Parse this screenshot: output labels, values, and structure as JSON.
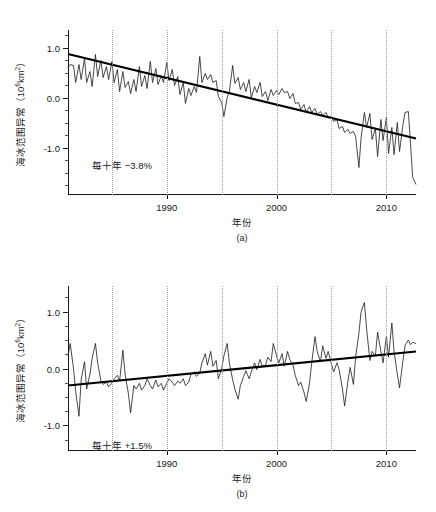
{
  "figure": {
    "background": "#ffffff",
    "line_color": "#1a1a1a",
    "trend_color": "#000000",
    "grid_color": "#9a9a9a"
  },
  "chart_data": [
    {
      "type": "line",
      "panel": "a",
      "caption": "(a)",
      "title": "",
      "xlabel": "年份",
      "ylabel": "海冰范围异常（10⁶km²）",
      "ylabel_text": "海冰范围异常（10",
      "ylabel_exp": "6",
      "ylabel_tail": "km",
      "ylabel_exp2": "2",
      "ylabel_close": "）",
      "annotation": "每十年 −3.8%",
      "trend_per_decade_percent": -3.8,
      "xlim": [
        1981,
        2012.7
      ],
      "ylim": [
        -1.95,
        1.35
      ],
      "grid": true,
      "grid_x": [
        1985,
        1990,
        1995,
        2000,
        2005,
        2010
      ],
      "xticks_labeled": [
        1990,
        2000,
        2010
      ],
      "xtick_labels": [
        "1990",
        "2000",
        "2010"
      ],
      "yticks_labeled": [
        1.0,
        0.0,
        -1.0
      ],
      "ytick_labels": [
        "1.0",
        "0.0",
        "-1.0"
      ],
      "yticks_minor": [
        1.25,
        0.75,
        0.5,
        0.25,
        -0.25,
        -0.5,
        -0.75,
        -1.25,
        -1.5,
        -1.75
      ],
      "trend_line": {
        "x": [
          1981,
          2012.7
        ],
        "y": [
          0.87,
          -0.82
        ]
      },
      "x": [
        1981.0,
        1981.2,
        1981.5,
        1981.7,
        1982.0,
        1982.2,
        1982.5,
        1982.7,
        1983.0,
        1983.2,
        1983.5,
        1983.7,
        1984.0,
        1984.2,
        1984.5,
        1984.7,
        1985.0,
        1985.2,
        1985.5,
        1985.7,
        1986.0,
        1986.2,
        1986.5,
        1986.7,
        1987.0,
        1987.2,
        1987.5,
        1987.7,
        1988.0,
        1988.2,
        1988.5,
        1988.7,
        1989.0,
        1989.2,
        1989.5,
        1989.7,
        1990.0,
        1990.2,
        1990.5,
        1990.7,
        1991.0,
        1991.2,
        1991.5,
        1991.7,
        1992.0,
        1992.2,
        1992.5,
        1992.7,
        1993.0,
        1993.2,
        1993.5,
        1993.7,
        1994.0,
        1994.2,
        1994.5,
        1994.7,
        1995.0,
        1995.2,
        1995.5,
        1995.7,
        1996.0,
        1996.2,
        1996.5,
        1996.7,
        1997.0,
        1997.2,
        1997.5,
        1997.7,
        1998.0,
        1998.2,
        1998.5,
        1998.7,
        1999.0,
        1999.2,
        1999.5,
        1999.7,
        2000.0,
        2000.2,
        2000.5,
        2000.7,
        2001.0,
        2001.2,
        2001.5,
        2001.7,
        2002.0,
        2002.2,
        2002.5,
        2002.7,
        2003.0,
        2003.2,
        2003.5,
        2003.7,
        2004.0,
        2004.2,
        2004.5,
        2004.7,
        2005.0,
        2005.2,
        2005.5,
        2005.7,
        2006.0,
        2006.2,
        2006.5,
        2006.7,
        2007.0,
        2007.2,
        2007.5,
        2007.7,
        2008.0,
        2008.2,
        2008.5,
        2008.7,
        2009.0,
        2009.2,
        2009.5,
        2009.7,
        2010.0,
        2010.2,
        2010.5,
        2010.7,
        2011.0,
        2011.2,
        2011.5,
        2011.7,
        2012.0,
        2012.2,
        2012.4,
        2012.7
      ],
      "y": [
        0.6,
        0.66,
        0.64,
        0.3,
        0.66,
        0.36,
        0.78,
        0.3,
        0.52,
        0.22,
        0.86,
        0.42,
        0.74,
        0.4,
        0.62,
        0.36,
        0.72,
        0.3,
        0.56,
        0.12,
        0.52,
        0.2,
        0.32,
        0.08,
        0.36,
        0.12,
        0.62,
        0.22,
        0.44,
        0.18,
        0.72,
        0.3,
        0.58,
        0.26,
        0.44,
        0.3,
        0.7,
        0.34,
        0.56,
        0.24,
        0.42,
        0.06,
        0.3,
        -0.12,
        0.18,
        0.04,
        0.22,
        0.1,
        0.82,
        0.3,
        0.48,
        0.36,
        0.46,
        0.3,
        0.34,
        0.02,
        -0.1,
        -0.38,
        0.0,
        0.12,
        0.64,
        0.28,
        0.4,
        0.16,
        0.3,
        0.12,
        0.36,
        0.0,
        0.22,
        0.1,
        0.3,
        0.02,
        0.12,
        -0.06,
        0.16,
        0.04,
        0.14,
        0.06,
        0.18,
        0.1,
        0.12,
        -0.02,
        0.08,
        -0.12,
        -0.1,
        -0.24,
        -0.14,
        -0.3,
        -0.18,
        -0.3,
        -0.22,
        -0.34,
        -0.28,
        -0.36,
        -0.3,
        -0.4,
        -0.38,
        -0.48,
        -0.44,
        -0.62,
        -0.58,
        -0.7,
        -0.64,
        -0.72,
        -0.68,
        -0.78,
        -1.4,
        -0.8,
        -0.3,
        -0.6,
        -0.32,
        -0.84,
        -0.62,
        -1.18,
        -0.44,
        -0.86,
        -0.4,
        -1.12,
        -0.6,
        -1.14,
        -0.5,
        -1.08,
        -0.56,
        -0.3,
        -0.28,
        -0.92,
        -1.6,
        -1.74
      ]
    },
    {
      "type": "line",
      "panel": "b",
      "caption": "(b)",
      "title": "",
      "xlabel": "年份",
      "ylabel": "海冰范围异常（10⁶km²）",
      "ylabel_text": "海冰范围异常（10",
      "ylabel_exp": "6",
      "ylabel_tail": "km",
      "ylabel_exp2": "2",
      "ylabel_close": "）",
      "annotation": "每十年 +1.5%",
      "trend_per_decade_percent": 1.5,
      "xlim": [
        1981,
        2012.7
      ],
      "ylim": [
        -1.45,
        1.45
      ],
      "grid": true,
      "grid_x": [
        1985,
        1990,
        1995,
        2000,
        2005,
        2010
      ],
      "xticks_labeled": [
        1990,
        2000,
        2010
      ],
      "xtick_labels": [
        "1990",
        "2000",
        "2010"
      ],
      "yticks_labeled": [
        1.0,
        0.0,
        -1.0
      ],
      "ytick_labels": [
        "1.0",
        "0.0",
        "-1.0"
      ],
      "yticks_minor": [
        1.25,
        0.75,
        0.5,
        0.25,
        -0.25,
        -0.5,
        -0.75,
        -1.25
      ],
      "trend_line": {
        "x": [
          1981,
          2012.7
        ],
        "y": [
          -0.3,
          0.3
        ]
      },
      "x": [
        1981.0,
        1981.2,
        1981.5,
        1981.7,
        1982.0,
        1982.2,
        1982.5,
        1982.7,
        1983.0,
        1983.2,
        1983.5,
        1983.7,
        1984.0,
        1984.2,
        1984.5,
        1984.7,
        1985.0,
        1985.2,
        1985.5,
        1985.7,
        1986.0,
        1986.2,
        1986.5,
        1986.7,
        1987.0,
        1987.2,
        1987.5,
        1987.7,
        1988.0,
        1988.2,
        1988.5,
        1988.7,
        1989.0,
        1989.2,
        1989.5,
        1989.7,
        1990.0,
        1990.2,
        1990.5,
        1990.7,
        1991.0,
        1991.2,
        1991.5,
        1991.7,
        1992.0,
        1992.2,
        1992.5,
        1992.7,
        1993.0,
        1993.2,
        1993.5,
        1993.7,
        1994.0,
        1994.2,
        1994.5,
        1994.7,
        1995.0,
        1995.2,
        1995.5,
        1995.7,
        1996.0,
        1996.2,
        1996.5,
        1996.7,
        1997.0,
        1997.2,
        1997.5,
        1997.7,
        1998.0,
        1998.2,
        1998.5,
        1998.7,
        1999.0,
        1999.2,
        1999.5,
        1999.7,
        2000.0,
        2000.2,
        2000.5,
        2000.7,
        2001.0,
        2001.2,
        2001.5,
        2001.7,
        2002.0,
        2002.2,
        2002.5,
        2002.7,
        2003.0,
        2003.2,
        2003.5,
        2003.7,
        2004.0,
        2004.2,
        2004.5,
        2004.7,
        2005.0,
        2005.2,
        2005.5,
        2005.7,
        2006.0,
        2006.2,
        2006.5,
        2006.7,
        2007.0,
        2007.2,
        2007.5,
        2007.7,
        2008.0,
        2008.2,
        2008.5,
        2008.7,
        2009.0,
        2009.2,
        2009.5,
        2009.7,
        2010.0,
        2010.2,
        2010.5,
        2010.7,
        2011.0,
        2011.2,
        2011.5,
        2011.7,
        2012.0,
        2012.2,
        2012.4,
        2012.7
      ],
      "y": [
        0.22,
        0.44,
        0.0,
        -0.4,
        -0.84,
        -0.2,
        0.12,
        -0.36,
        -0.1,
        0.18,
        0.44,
        0.1,
        -0.22,
        -0.28,
        -0.24,
        -0.32,
        -0.26,
        -0.18,
        -0.12,
        -0.22,
        0.32,
        -0.1,
        -0.44,
        -0.78,
        -0.3,
        -0.36,
        -0.26,
        -0.38,
        -0.3,
        -0.18,
        -0.3,
        -0.36,
        -0.2,
        -0.32,
        -0.26,
        -0.38,
        -0.26,
        -0.18,
        -0.24,
        -0.3,
        -0.22,
        -0.26,
        -0.18,
        -0.3,
        -0.24,
        -0.1,
        -0.06,
        -0.14,
        -0.08,
        0.1,
        0.26,
        0.06,
        0.3,
        0.04,
        0.14,
        -0.18,
        0.0,
        0.22,
        0.44,
        0.1,
        -0.2,
        -0.36,
        -0.54,
        -0.3,
        -0.14,
        -0.04,
        -0.18,
        -0.06,
        0.1,
        -0.02,
        0.16,
        0.04,
        0.06,
        0.2,
        0.12,
        0.44,
        0.22,
        0.1,
        0.26,
        0.04,
        0.3,
        0.16,
        0.06,
        -0.12,
        -0.3,
        -0.24,
        -0.42,
        -0.58,
        -0.26,
        0.1,
        0.56,
        0.3,
        0.12,
        0.4,
        0.18,
        0.3,
        0.08,
        -0.06,
        0.1,
        -0.02,
        -0.36,
        -0.66,
        -0.22,
        0.02,
        -0.28,
        0.2,
        0.62,
        1.0,
        1.16,
        0.7,
        0.14,
        0.3,
        0.22,
        0.64,
        0.3,
        0.1,
        0.56,
        0.2,
        0.8,
        0.3,
        -0.1,
        -0.34,
        0.12,
        0.4,
        0.5,
        0.42,
        0.46,
        0.44
      ]
    }
  ]
}
